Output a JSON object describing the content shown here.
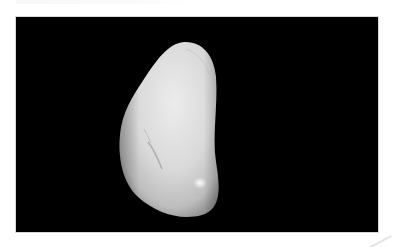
{
  "image": {
    "subject": "white polished pebble",
    "background_color": "#000000",
    "page_background": "#ffffff",
    "stone_colors": {
      "highlight": "#f4f4f4",
      "base": "#d6d6d6",
      "shadow": "#9a9a9a"
    }
  }
}
